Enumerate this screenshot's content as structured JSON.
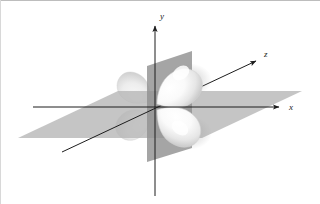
{
  "figure": {
    "kind": "3d-orbital-diagram",
    "title": "",
    "caption": "",
    "width": 320,
    "height": 204,
    "background_color": "#ffffff",
    "border": {
      "visible": true,
      "color": "#b9b9b9",
      "edges": "top-and-left-hairline"
    }
  },
  "axes": {
    "labels": {
      "x": "x",
      "y": "y",
      "z": "z"
    },
    "style": {
      "color": "#1d1d1d",
      "stroke_width": 1,
      "label_style": "italic-serif",
      "arrowheads": true
    },
    "origin": {
      "x": 155,
      "y": 107
    },
    "x_axis": {
      "label": "x",
      "from": {
        "x": 33,
        "y": 107
      },
      "to": {
        "x": 281,
        "y": 107
      },
      "label_pos": {
        "x": 289,
        "y": 110
      },
      "arrow": "right"
    },
    "y_axis": {
      "label": "y",
      "from": {
        "x": 155,
        "y": 196
      },
      "to": {
        "x": 155,
        "y": 24
      },
      "label_pos": {
        "x": 160,
        "y": 18
      },
      "arrow": "up"
    },
    "z_axis": {
      "label": "z",
      "from": {
        "x": 62,
        "y": 152
      },
      "to": {
        "x": 258,
        "y": 60
      },
      "label_pos": {
        "x": 265,
        "y": 56
      },
      "arrow": "upper-right"
    }
  },
  "nodal_planes": [
    {
      "name": "horizontal-plane",
      "orientation": "horizontal",
      "description": "xz nodal plane drawn in perspective as a parallelogram",
      "fill_color": "#b6b6b6",
      "opacity": 0.82,
      "points": "18,138 118,91 302,91 202,138"
    },
    {
      "name": "vertical-plane",
      "orientation": "vertical",
      "description": "vertical nodal plane drawn in perspective as a parallelogram",
      "fill_color": "#8e8e8e",
      "opacity": 0.85,
      "points": "147,66 192,51 192,148 147,162"
    }
  ],
  "orbital": {
    "name": "d-orbital",
    "lobe_count": 4,
    "surface_color": "#fdfdfd",
    "shadow_color": "#bdbdbd",
    "highlight_color": "#ffffff",
    "lobes": [
      {
        "name": "lobe-upper-right",
        "direction": "upper-right",
        "depth": "front",
        "cx": 185,
        "cy": 78,
        "rx": 26,
        "ry": 20,
        "rotation": -34
      },
      {
        "name": "lobe-lower-right",
        "direction": "lower-right",
        "depth": "front",
        "cx": 185,
        "cy": 134,
        "rx": 26,
        "ry": 20,
        "rotation": 34
      },
      {
        "name": "lobe-upper-left",
        "direction": "upper-left",
        "depth": "back",
        "cx": 128,
        "cy": 78,
        "rx": 19,
        "ry": 15,
        "rotation": 34
      },
      {
        "name": "lobe-lower-left",
        "direction": "lower-left",
        "depth": "back",
        "cx": 128,
        "cy": 134,
        "rx": 19,
        "ry": 15,
        "rotation": -34
      }
    ]
  }
}
